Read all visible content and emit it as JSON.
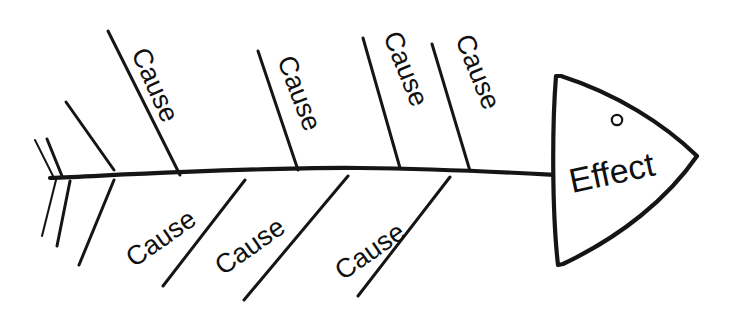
{
  "diagram": {
    "type": "fishbone-ishikawa-diagram",
    "title": "",
    "stroke_color": "#151515",
    "background_color": "#ffffff",
    "effect": {
      "label": "Effect",
      "rotation_deg": -12,
      "x": 592,
      "y": 193
    },
    "eye": {
      "name": "fish-eye",
      "cx": 617,
      "cy": 120,
      "r": 5.2
    },
    "head_outline_path": "M 556 76 C 552 126 552 212 558 265 L 563 264 C 622 236 668 198 697 156 C 664 124 617 94 561 76 Z",
    "spine_path": "M 50 178 C 140 174 260 167 360 168 C 450 169 520 173 558 175",
    "upper_causes": [
      {
        "label": "Cause",
        "bone": {
          "x1": 180,
          "y1": 175,
          "x2": 108,
          "y2": 31
        },
        "text_x": 131,
        "text_y": 53,
        "rotation_deg": 66
      },
      {
        "label": "Cause",
        "bone": {
          "x1": 298,
          "y1": 170,
          "x2": 258,
          "y2": 51
        },
        "text_x": 277,
        "text_y": 60,
        "rotation_deg": 69
      },
      {
        "label": "Cause",
        "bone": {
          "x1": 400,
          "y1": 168,
          "x2": 363,
          "y2": 38
        },
        "text_x": 383,
        "text_y": 36,
        "rotation_deg": 68
      },
      {
        "label": "Cause",
        "bone": {
          "x1": 470,
          "y1": 171,
          "x2": 432,
          "y2": 44
        },
        "text_x": 455,
        "text_y": 39,
        "rotation_deg": 68
      }
    ],
    "lower_causes": [
      {
        "label": "Cause",
        "bone": {
          "x1": 245,
          "y1": 180,
          "x2": 163,
          "y2": 286
        },
        "text_x": 134,
        "text_y": 268,
        "rotation_deg": -35
      },
      {
        "label": "Cause",
        "bone": {
          "x1": 348,
          "y1": 176,
          "x2": 244,
          "y2": 300
        },
        "text_x": 223,
        "text_y": 276,
        "rotation_deg": -35
      },
      {
        "label": "Cause",
        "bone": {
          "x1": 450,
          "y1": 177,
          "x2": 358,
          "y2": 296
        },
        "text_x": 343,
        "text_y": 281,
        "rotation_deg": -35
      }
    ],
    "tail_lines": [
      {
        "name": "tail-upper-outer",
        "x1": 53,
        "y1": 176,
        "x2": 35,
        "y2": 140,
        "weight": "thin"
      },
      {
        "name": "tail-upper-middle",
        "x1": 62,
        "y1": 176,
        "x2": 47,
        "y2": 139,
        "weight": "normal"
      },
      {
        "name": "tail-upper-inner",
        "x1": 114,
        "y1": 170,
        "x2": 66,
        "y2": 102,
        "weight": "normal"
      },
      {
        "name": "tail-lower-outer",
        "x1": 56,
        "y1": 180,
        "x2": 42,
        "y2": 236,
        "weight": "thin"
      },
      {
        "name": "tail-lower-middle",
        "x1": 70,
        "y1": 181,
        "x2": 57,
        "y2": 246,
        "weight": "normal"
      },
      {
        "name": "tail-lower-inner",
        "x1": 114,
        "y1": 180,
        "x2": 79,
        "y2": 265,
        "weight": "normal"
      }
    ]
  }
}
